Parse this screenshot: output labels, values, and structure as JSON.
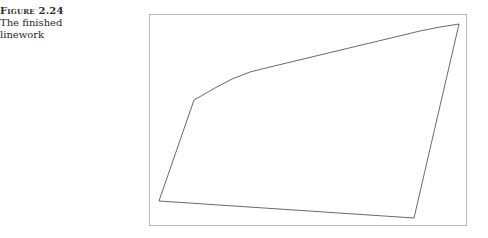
{
  "caption": {
    "label": "Figure 2.24",
    "line1": "The finished",
    "line2": "linework"
  },
  "figure": {
    "frame": {
      "x": 149,
      "y": 14,
      "width": 317,
      "height": 211,
      "stroke": "#b8b8b8"
    },
    "linework_stroke": "#6a6a6a",
    "polygon_points": "194,100 215,88 232,79 250,72 270,67 420,31 440,27 459,24 414,218 159,201"
  }
}
